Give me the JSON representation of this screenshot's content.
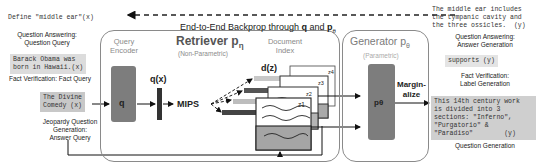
{
  "backprop": {
    "label_prefix": "End-to-End Backprop through ",
    "q": "q",
    "and": " and ",
    "p": "p",
    "theta": "θ"
  },
  "inputs": [
    {
      "text": "Define \"middle ear\"(x)",
      "caption": "Question Answering:\nQuestion Query"
    },
    {
      "text": "Barack Obama was\nborn in Hawaii.(x)",
      "caption": "Fact Verification: Fact Query"
    },
    {
      "text": "The Divine\nComedy (x)",
      "caption": "Jeopardy Question\nGeneration:\nAnswer Query"
    }
  ],
  "retriever": {
    "title": "Retriever p",
    "title_sub": "η",
    "subtitle": "(Non-Parametric)",
    "query_encoder": "Query\nEncoder",
    "q_block": "q",
    "qx": "q(x)",
    "mips": "MIPS",
    "doc_index": "Document\nIndex",
    "dz": "d(z)",
    "docs": [
      "z4",
      "z3",
      "z2",
      "z1"
    ]
  },
  "generator": {
    "title": "Generator p",
    "title_sub": "θ",
    "subtitle": "(Parametric)",
    "p_block": "pθ",
    "marginalize": "Margin-\nalize"
  },
  "outputs": [
    {
      "text": "The middle ear includes\nthe tympanic cavity and\nthe three ossicles.  (y)",
      "caption": "Question Answering:\nAnswer Generation"
    },
    {
      "text": "supports (y)",
      "caption": "Fact Verification:\nLabel Generation"
    },
    {
      "text": "This 14th century work\nis divided into 3\nsections: \"Inferno\",\n\"Purgatorio\" &\n\"Paradiso\"        (y)",
      "caption": "Question Generation"
    }
  ]
}
